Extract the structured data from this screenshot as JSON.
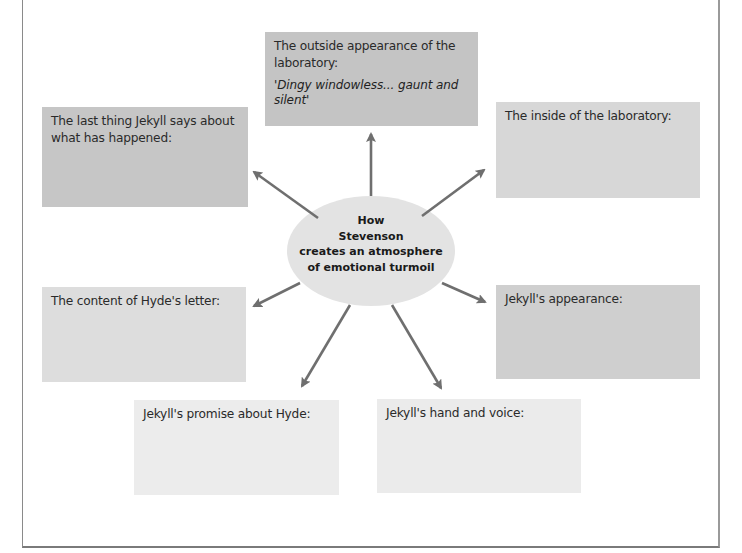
{
  "diagram": {
    "type": "spider-diagram",
    "center": {
      "lines": [
        "How",
        "Stevenson",
        "creates an atmosphere",
        "of emotional turmoil"
      ],
      "fill": "#e3e3e3"
    },
    "nodes": [
      {
        "id": "outside-lab",
        "label": "The outside appearance of the laboratory:",
        "quote": "'Dingy windowless... gaunt and silent'",
        "fill": "#c4c4c4"
      },
      {
        "id": "last-thing",
        "label": "The last thing Jekyll says about what has happened:",
        "fill": "#c6c6c6"
      },
      {
        "id": "inside-lab",
        "label": "The inside of the laboratory:",
        "fill": "#d7d7d7"
      },
      {
        "id": "hyde-letter",
        "label": "The content of Hyde's letter:",
        "fill": "#dddddd"
      },
      {
        "id": "jekyll-appearance",
        "label": "Jekyll's appearance:",
        "fill": "#cfcfcf"
      },
      {
        "id": "jekyll-promise",
        "label": "Jekyll's promise about Hyde:",
        "fill": "#ececec"
      },
      {
        "id": "hand-voice",
        "label": "Jekyll's hand and voice:",
        "fill": "#ebebeb"
      }
    ],
    "arrow_color": "#6f6f6f"
  }
}
